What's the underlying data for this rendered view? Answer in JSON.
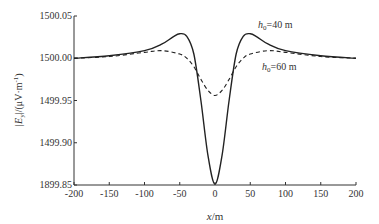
{
  "chart_data": {
    "type": "line",
    "title": "",
    "xlabel": "x/m",
    "ylabel": "|E_y|/(μV·m⁻¹)",
    "xlim": [
      -200,
      200
    ],
    "ylim": [
      1499.85,
      1500.05
    ],
    "grid": false,
    "x_ticks": [
      "-200",
      "-150",
      "-100",
      "-50",
      "0",
      "50",
      "100",
      "150",
      "200"
    ],
    "y_ticks": [
      "1899.85",
      "1499.90",
      "1499.95",
      "1500.00",
      "1500.05"
    ],
    "series": [
      {
        "name": "h0=40 m",
        "style": "solid",
        "x": [
          -200,
          -150,
          -100,
          -75,
          -60,
          -50,
          -40,
          -30,
          -20,
          -10,
          0,
          10,
          20,
          30,
          40,
          50,
          60,
          75,
          100,
          150,
          200
        ],
        "y": [
          1500.0,
          1500.003,
          1500.009,
          1500.017,
          1500.025,
          1500.029,
          1500.026,
          1500.005,
          1499.95,
          1499.885,
          1499.851,
          1499.885,
          1499.95,
          1500.005,
          1500.026,
          1500.029,
          1500.025,
          1500.017,
          1500.009,
          1500.003,
          1500.0
        ]
      },
      {
        "name": "h0=60 m",
        "style": "dashed",
        "x": [
          -200,
          -150,
          -100,
          -75,
          -50,
          -40,
          -30,
          -20,
          -10,
          0,
          10,
          20,
          30,
          40,
          50,
          75,
          100,
          150,
          200
        ],
        "y": [
          1500.0,
          1500.002,
          1500.007,
          1500.009,
          1500.005,
          1500.0,
          1499.99,
          1499.975,
          1499.962,
          1499.956,
          1499.962,
          1499.975,
          1499.99,
          1500.0,
          1500.005,
          1500.009,
          1500.007,
          1500.002,
          1500.0
        ]
      }
    ],
    "annotations": [
      {
        "text_main": "h",
        "text_sub": "0",
        "text_rest": "=40  m",
        "x": 55,
        "y": 1500.03
      },
      {
        "text_main": "h",
        "text_sub": "0",
        "text_rest": "=60  m",
        "x": 55,
        "y": 1499.99
      }
    ]
  },
  "labels": {
    "xlabel_var": "x",
    "xlabel_unit": "/m",
    "ylabel_pre": "|E",
    "ylabel_sub": "y",
    "ylabel_post": "|/(μV·m",
    "ylabel_sup": "-1",
    "ylabel_end": ")"
  }
}
